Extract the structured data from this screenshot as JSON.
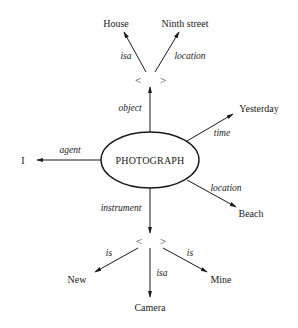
{
  "diagram": {
    "type": "semantic-network",
    "center": {
      "label": "PHOTOGRAPH",
      "x": 150,
      "y": 160
    },
    "object_node": {
      "left": "<",
      "right": ">",
      "x": 150,
      "y": 80
    },
    "instrument_node": {
      "left": "<",
      "right": ">",
      "x": 150,
      "y": 241
    },
    "nodes": {
      "house": "House",
      "ninth_street": "Ninth street",
      "yesterday": "Yesterday",
      "beach": "Beach",
      "agent_value": "I",
      "new": "New",
      "camera": "Camera",
      "mine": "Mine"
    },
    "edges": {
      "isa_top": "isa",
      "location_top": "location",
      "object": "object",
      "time": "time",
      "agent": "agent",
      "location_right": "location",
      "instrument": "instrument",
      "is_left": "is",
      "isa_bottom": "isa",
      "is_right": "is"
    },
    "colors": {
      "ink": "#1a1a1a",
      "background": "#ffffff"
    }
  }
}
